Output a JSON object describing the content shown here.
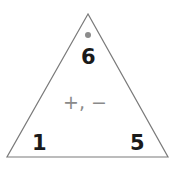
{
  "fact_triangle": {
    "top_number": "6",
    "bottom_left_number": "1",
    "bottom_right_number": "5",
    "operations": "+, −",
    "colors": {
      "outline": "#7a7a7a",
      "numbers": "#1a1a1a",
      "operations": "#8a8a8a",
      "marker_dot": "#8c8c8c"
    }
  }
}
